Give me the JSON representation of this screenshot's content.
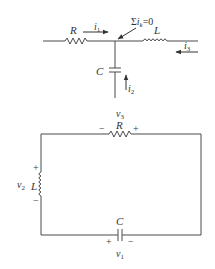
{
  "figure": {
    "top_circuit": {
      "title": "KCL node",
      "labels": {
        "resistor": "R",
        "inductor": "L",
        "capacitor": "C",
        "current_1": "i",
        "current_1_sub": "1",
        "current_2": "i",
        "current_2_sub": "2",
        "current_3": "i",
        "current_3_sub": "3",
        "kcl_sigma": "Σ",
        "kcl_i": "i",
        "kcl_sub": "k",
        "kcl_eq": "=0"
      }
    },
    "bottom_circuit": {
      "title": "KVL loop",
      "labels": {
        "resistor": "R",
        "resistor_voltage": "v",
        "resistor_voltage_sub": "3",
        "resistor_minus": "−",
        "resistor_plus": "+",
        "inductor": "L",
        "inductor_voltage": "v",
        "inductor_voltage_sub": "2",
        "inductor_plus": "+",
        "inductor_minus": "−",
        "capacitor": "C",
        "capacitor_voltage": "v",
        "capacitor_voltage_sub": "1",
        "capacitor_plus": "+",
        "capacitor_minus": "−"
      }
    },
    "colors": {
      "stroke": "#4a4a4a",
      "text": "#333333",
      "background": "#ffffff"
    }
  }
}
